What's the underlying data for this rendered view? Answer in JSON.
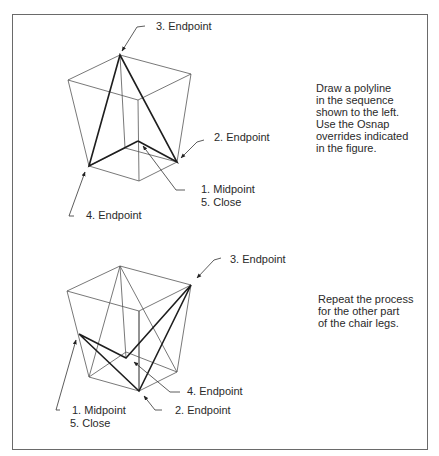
{
  "figure_top": {
    "labels": {
      "endpoint3": "3. Endpoint",
      "endpoint2": "2. Endpoint",
      "midpoint1": "1. Midpoint",
      "close5": "5. Close",
      "endpoint4": "4. Endpoint"
    },
    "instructions": [
      "Draw a polyline",
      "in the sequence",
      "shown to the left.",
      "Use the Osnap",
      "overrides indicated",
      "in the figure."
    ]
  },
  "figure_bottom": {
    "labels": {
      "endpoint3": "3. Endpoint",
      "endpoint4": "4. Endpoint",
      "midpoint1": "1. Midpoint",
      "close5": "5. Close",
      "endpoint2": "2. Endpoint"
    },
    "instructions": [
      "Repeat the process",
      "for the other part",
      "of the chair legs."
    ]
  },
  "colors": {
    "line": "#3a3a3a",
    "bold": "#1e1e1e",
    "frame": "#6a6a6a"
  }
}
